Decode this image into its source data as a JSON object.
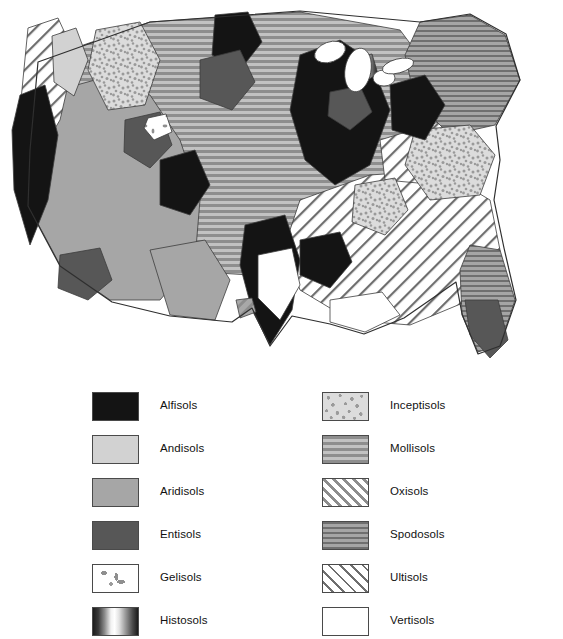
{
  "map": {
    "title": "Soil Orders of the Conterminous United States",
    "region": "conterminous-united-states",
    "background_color": "#ffffff",
    "outline_color": "#3c3c3c"
  },
  "legend": {
    "columns": [
      {
        "id": "left",
        "items": [
          {
            "label": "Alfisols",
            "pattern": "solid-black",
            "color": "#141414"
          },
          {
            "label": "Andisols",
            "pattern": "solid-light-gray",
            "color": "#d2d2d2"
          },
          {
            "label": "Aridisols",
            "pattern": "solid-medium-gray",
            "color": "#a6a6a6"
          },
          {
            "label": "Entisols",
            "pattern": "solid-dark-gray",
            "color": "#575757"
          },
          {
            "label": "Gelisols",
            "pattern": "white-with-specks",
            "color": "#ffffff"
          },
          {
            "label": "Histosols",
            "pattern": "horizontal-gradient",
            "color": "#1c1c1c"
          }
        ]
      },
      {
        "id": "right",
        "items": [
          {
            "label": "Inceptisols",
            "pattern": "mottled-stipple",
            "color": "#dcdcdc"
          },
          {
            "label": "Mollisols",
            "pattern": "horizontal-lines-wide",
            "color": "#8e8e8e"
          },
          {
            "label": "Oxisols",
            "pattern": "diagonal-hatch-gray",
            "color": "#a8a8a8"
          },
          {
            "label": "Spodosols",
            "pattern": "horizontal-lines-fine",
            "color": "#6f6f6f"
          },
          {
            "label": "Ultisols",
            "pattern": "diagonal-hatch-white",
            "color": "#ffffff"
          },
          {
            "label": "Vertisols",
            "pattern": "solid-white",
            "color": "#ffffff"
          }
        ]
      }
    ]
  }
}
